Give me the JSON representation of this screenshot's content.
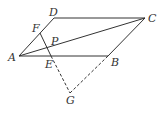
{
  "diagram": {
    "type": "geometry",
    "points": {
      "A": {
        "label": "A",
        "x": 19,
        "y": 56
      },
      "B": {
        "label": "B",
        "x": 108,
        "y": 56
      },
      "C": {
        "label": "C",
        "x": 145,
        "y": 18
      },
      "D": {
        "label": "D",
        "x": 54,
        "y": 18
      },
      "E": {
        "label": "E",
        "x": 51,
        "y": 56
      },
      "F": {
        "label": "F",
        "x": 40,
        "y": 33
      },
      "P": {
        "label": "P",
        "x": 48,
        "y": 48
      },
      "G": {
        "label": "G",
        "x": 70,
        "y": 93
      }
    },
    "solid_segments": [
      "AB",
      "BC",
      "CD",
      "DA",
      "AC",
      "FE"
    ],
    "dashed_segments": [
      "EG",
      "GB"
    ]
  }
}
